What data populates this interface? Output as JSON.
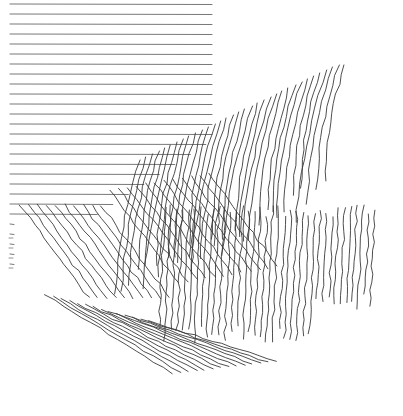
{
  "artwork": {
    "description": "Line-art drawing: horizontal hatch lines at top-left transitioning into diagonal and vertical wavy strokes forming a torn-paper / contour shape",
    "stroke_color": "#3a3a3a",
    "background": "#ffffff",
    "horizontal_lines": {
      "x_start": 10,
      "y_start": 4,
      "spacing": 10,
      "count": 27,
      "x_end_top": 212
    },
    "diagonal_band": {
      "count": 34
    },
    "vertical_band": {
      "count": 36
    },
    "lower_tail": {
      "count": 14
    }
  }
}
